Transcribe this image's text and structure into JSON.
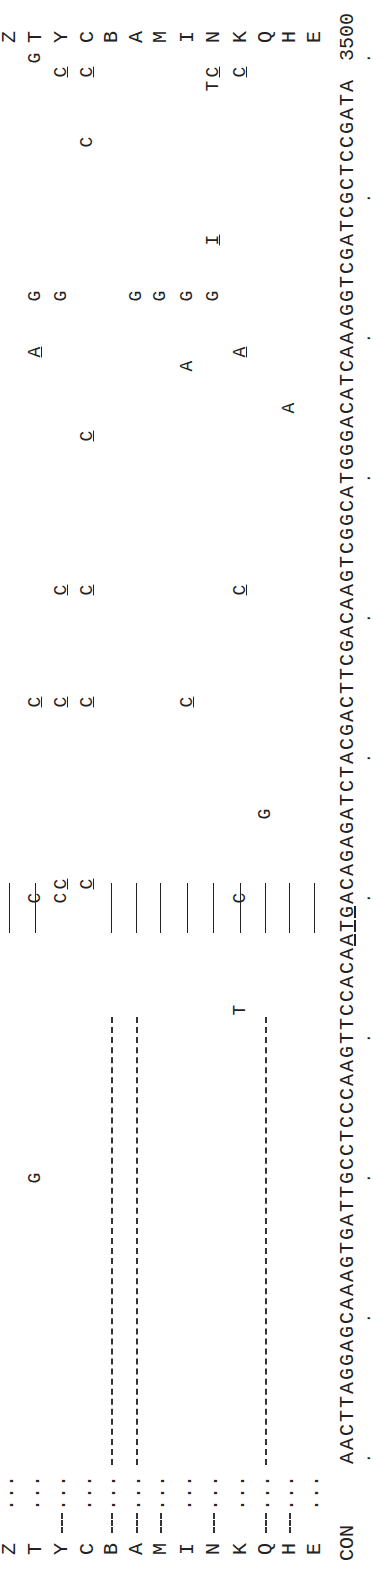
{
  "figure": {
    "consensus_label": "CON",
    "consensus_sequence": "AACTTAGGAGCAAAGTGATTGCCTCCCAAGTTCCACAATGACAGAGATCTACGACTTCGACAAGTCGGCATGGGACATCAAAGGTCGATCGCTCCGATA",
    "end_position": "3500",
    "underlined_consensus_range": [
      37,
      39
    ],
    "rows": [
      {
        "label": "E"
      },
      {
        "label": "H"
      },
      {
        "label": "Q"
      },
      {
        "label": "K"
      },
      {
        "label": "N"
      },
      {
        "label": "I"
      },
      {
        "label": "M"
      },
      {
        "label": "A"
      },
      {
        "label": "B"
      },
      {
        "label": "C"
      },
      {
        "label": "Y"
      },
      {
        "label": "T"
      },
      {
        "label": "Z"
      }
    ],
    "start_markers": "...",
    "mutations": [
      {
        "row": "Q",
        "pos": 46,
        "base": "G"
      },
      {
        "row": "K",
        "pos": 32,
        "base": "T"
      },
      {
        "row": "K",
        "pos": 40,
        "base": "C"
      },
      {
        "row": "K",
        "pos": 62,
        "base": "C",
        "underline": true
      },
      {
        "row": "K",
        "pos": 79,
        "base": "A",
        "underline": true
      },
      {
        "row": "K",
        "pos": 99,
        "base": "C",
        "underline": true
      },
      {
        "row": "N",
        "pos": 87,
        "base": "I",
        "underline": true
      },
      {
        "row": "N",
        "pos": 98,
        "base": "T"
      },
      {
        "row": "N",
        "pos": 99,
        "base": "C",
        "underline": true
      },
      {
        "row": "N",
        "pos": 83,
        "base": "G"
      },
      {
        "row": "H",
        "pos": 75,
        "base": "A"
      },
      {
        "row": "I",
        "pos": 54,
        "base": "C",
        "underline": true
      },
      {
        "row": "I",
        "pos": 78,
        "base": "A"
      },
      {
        "row": "I",
        "pos": 83,
        "base": "G"
      },
      {
        "row": "M",
        "pos": 83,
        "base": "G"
      },
      {
        "row": "A",
        "pos": 83,
        "base": "G"
      },
      {
        "row": "C",
        "pos": 41,
        "base": "C",
        "underline": true
      },
      {
        "row": "C",
        "pos": 54,
        "base": "C",
        "underline": true
      },
      {
        "row": "C",
        "pos": 62,
        "base": "C",
        "underline": true
      },
      {
        "row": "C",
        "pos": 73,
        "base": "C",
        "underline": true
      },
      {
        "row": "C",
        "pos": 94,
        "base": "C"
      },
      {
        "row": "C",
        "pos": 99,
        "base": "C",
        "underline": true
      },
      {
        "row": "Y",
        "pos": 40,
        "base": "C"
      },
      {
        "row": "Y",
        "pos": 41,
        "base": "C",
        "underline": true
      },
      {
        "row": "Y",
        "pos": 54,
        "base": "C",
        "underline": true
      },
      {
        "row": "Y",
        "pos": 62,
        "base": "C",
        "underline": true
      },
      {
        "row": "Y",
        "pos": 83,
        "base": "G"
      },
      {
        "row": "Y",
        "pos": 99,
        "base": "C",
        "underline": true
      },
      {
        "row": "T",
        "pos": 40,
        "base": "C"
      },
      {
        "row": "T",
        "pos": 20,
        "base": "G"
      },
      {
        "row": "T",
        "pos": 54,
        "base": "C",
        "underline": true
      },
      {
        "row": "T",
        "pos": 79,
        "base": "A",
        "underline": true
      },
      {
        "row": "T",
        "pos": 83,
        "base": "G"
      },
      {
        "row": "T",
        "pos": 100,
        "base": "G"
      }
    ],
    "deletions": [
      {
        "row": "H",
        "type": "start-dash"
      },
      {
        "row": "Q",
        "type": "start-dash"
      },
      {
        "row": "N",
        "type": "start-dash"
      },
      {
        "row": "M",
        "type": "start-dash"
      },
      {
        "row": "A",
        "type": "start-dash"
      },
      {
        "row": "B",
        "type": "start-dash"
      },
      {
        "row": "Y",
        "type": "start-dash"
      },
      {
        "row": "Q",
        "type": "long-dash",
        "from": 0,
        "to": 32
      },
      {
        "row": "A",
        "type": "long-dash",
        "from": 0,
        "to": 32
      },
      {
        "row": "B",
        "type": "long-dash",
        "from": 0,
        "to": 32
      }
    ],
    "insertion_bars_rows": [
      "E",
      "H",
      "Q",
      "K",
      "N",
      "I",
      "M",
      "A",
      "B",
      "T",
      "Z"
    ]
  }
}
